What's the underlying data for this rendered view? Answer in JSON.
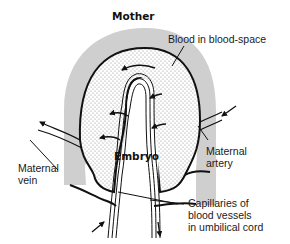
{
  "diagram": {
    "title": "Mother",
    "labels": {
      "blood_space": "Blood in blood-space",
      "embryo": "Embryo",
      "maternal_vein": [
        "Maternal",
        "vein"
      ],
      "maternal_artery": [
        "Maternal",
        "artery"
      ],
      "capillaries": [
        "Capillaries of",
        "blood vessels",
        "in umbilical cord"
      ]
    },
    "colors": {
      "tissue": "#cfcfcf",
      "outline": "#111111",
      "stipple": "#8a8a8a",
      "background": "#ffffff"
    }
  }
}
